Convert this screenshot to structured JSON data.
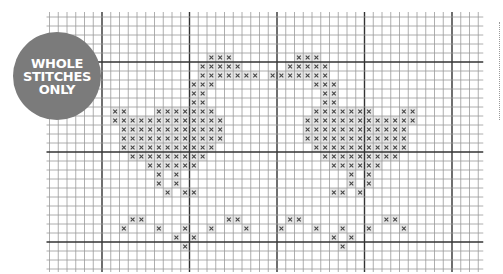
{
  "badge": {
    "lines": [
      "WHOLE",
      "STITCHES",
      "ONLY"
    ],
    "color": "#7b7b7b",
    "text_color": "#ffffff"
  },
  "grid": {
    "origin_x": 102,
    "origin_y": 62,
    "cell_w": 8.75,
    "cell_h": 9,
    "col_min": -6,
    "col_max": 42,
    "row_min": -5,
    "row_max": 22,
    "major_every": 10,
    "thin_color": "#9a9a9a",
    "thick_color": "#333333",
    "stitch_color": "#444444",
    "stitch_bg": "#e6e6e6"
  },
  "stitch_symbol": "cross",
  "stitches": {
    "-1": [
      12,
      13,
      14,
      22,
      23,
      24
    ],
    "0": [
      11,
      12,
      13,
      14,
      15,
      21,
      22,
      23,
      24,
      25
    ],
    "1": [
      11,
      12,
      13,
      14,
      15,
      16,
      17,
      19,
      20,
      21,
      22,
      23,
      24,
      25
    ],
    "2": [
      10,
      11,
      12,
      24,
      25,
      26
    ],
    "3": [
      10,
      11,
      25,
      26
    ],
    "4": [
      10,
      11,
      25,
      26
    ],
    "5": [
      1,
      2,
      6,
      7,
      8,
      9,
      10,
      11,
      12,
      24,
      25,
      26,
      27,
      28,
      29,
      30,
      34,
      35
    ],
    "6": [
      1,
      2,
      3,
      4,
      5,
      6,
      7,
      8,
      9,
      10,
      11,
      12,
      13,
      23,
      24,
      25,
      26,
      27,
      28,
      29,
      30,
      31,
      32,
      33,
      34,
      35
    ],
    "7": [
      2,
      3,
      4,
      5,
      6,
      7,
      8,
      9,
      10,
      11,
      12,
      13,
      23,
      24,
      25,
      26,
      27,
      28,
      29,
      30,
      31,
      32,
      33,
      34
    ],
    "8": [
      2,
      3,
      4,
      5,
      6,
      7,
      8,
      9,
      10,
      11,
      12,
      13,
      23,
      24,
      25,
      26,
      27,
      28,
      29,
      30,
      31,
      32,
      33,
      34
    ],
    "9": [
      2,
      3,
      4,
      5,
      6,
      7,
      8,
      9,
      10,
      11,
      12,
      24,
      25,
      26,
      27,
      28,
      29,
      30,
      31,
      32,
      33,
      34
    ],
    "10": [
      3,
      4,
      5,
      6,
      7,
      8,
      9,
      10,
      11,
      25,
      26,
      27,
      28,
      29,
      30,
      31,
      32,
      33
    ],
    "11": [
      5,
      6,
      7,
      8,
      9,
      10,
      26,
      27,
      28,
      29,
      30,
      31
    ],
    "12": [
      6,
      8,
      28,
      30
    ],
    "13": [
      6,
      8,
      28,
      30
    ],
    "14": [
      7,
      9,
      10,
      26,
      27,
      29
    ],
    "17": [
      3,
      4,
      14,
      15,
      21,
      22,
      32,
      33
    ],
    "18": [
      2,
      6,
      9,
      12,
      16,
      20,
      24,
      27,
      30,
      34
    ],
    "19": [
      8,
      10,
      26,
      28
    ],
    "20": [
      9,
      27
    ]
  },
  "side_marker": {
    "style": "dotted",
    "color": "#9a9a9a"
  }
}
